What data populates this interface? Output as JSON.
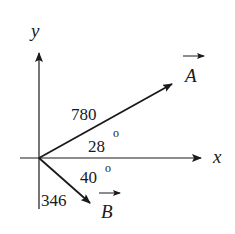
{
  "diagram": {
    "axes": {
      "x_label": "x",
      "y_label": "y"
    },
    "vectors": [
      {
        "name": "A",
        "magnitude": "780",
        "angle": "28",
        "angle_unit": "o",
        "direction": "above +x axis"
      },
      {
        "name": "B",
        "magnitude": "346",
        "angle": "40",
        "angle_unit": "o",
        "direction": "below +x axis"
      }
    ],
    "colors": {
      "ink": "#1a1a1a",
      "background": "#ffffff"
    }
  }
}
